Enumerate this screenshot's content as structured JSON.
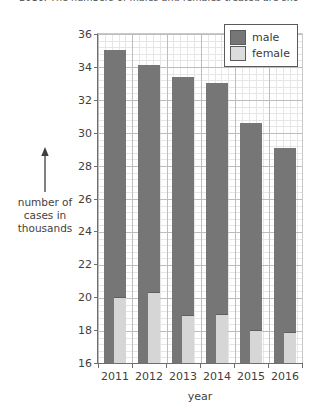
{
  "caption": "2016. The numbers of males and females treated are sho",
  "chart_data": {
    "type": "bar",
    "subtype": "grouped-overlay",
    "title": "",
    "xlabel": "year",
    "ylabel": "number of cases in thousands",
    "categories": [
      "2011",
      "2012",
      "2013",
      "2014",
      "2015",
      "2016"
    ],
    "series": [
      {
        "name": "male",
        "color": "#767676",
        "values": [
          35.0,
          34.1,
          33.4,
          33.0,
          30.6,
          29.1
        ]
      },
      {
        "name": "female",
        "color": "#d6d6d6",
        "values": [
          20.0,
          20.3,
          18.9,
          19.0,
          18.0,
          17.9
        ]
      }
    ],
    "ylim": [
      16,
      36
    ],
    "ytick_step": 2,
    "yticks": [
      "36",
      "34",
      "32",
      "30",
      "28",
      "26",
      "24",
      "22",
      "20",
      "18",
      "16"
    ],
    "grid": true,
    "minor_grid": true,
    "legend_position": "top-right"
  },
  "legend": {
    "items": [
      {
        "label": "male"
      },
      {
        "label": "female"
      }
    ]
  },
  "axis": {
    "x_title": "year",
    "y_title_lines": [
      "number of",
      "cases in",
      "thousands"
    ],
    "y_arrow_icon": "up-arrow-icon"
  }
}
